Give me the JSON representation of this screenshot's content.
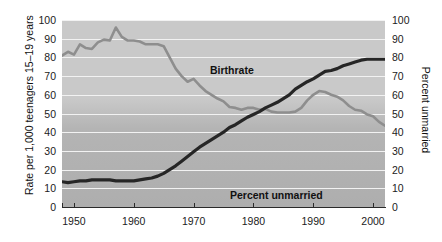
{
  "chart_data": {
    "type": "line",
    "title": "",
    "xlabel": "",
    "ylabel": "Rate per 1,000 teenagers 15–19 years",
    "y2label": "Percent unmarried",
    "xlim": [
      1948,
      2002
    ],
    "ylim": [
      0,
      100
    ],
    "y2lim": [
      0,
      100
    ],
    "grid": true,
    "legend_position": "inline-annotation",
    "xticks": [
      1950,
      1960,
      1970,
      1980,
      1990,
      2000
    ],
    "xtick_labels": [
      "1950",
      "1960",
      "1970",
      "1980",
      "1990",
      "2000"
    ],
    "yticks": [
      0,
      10,
      20,
      30,
      40,
      50,
      60,
      70,
      80,
      90,
      100
    ],
    "ytick_labels": [
      "0",
      "10",
      "20",
      "30",
      "40",
      "50",
      "60",
      "70",
      "80",
      "90",
      "100"
    ],
    "y2ticks": [
      0,
      10,
      20,
      30,
      40,
      50,
      60,
      70,
      80,
      90,
      100
    ],
    "y2tick_labels": [
      "0",
      "10",
      "20",
      "30",
      "40",
      "50",
      "60",
      "70",
      "80",
      "90",
      "100"
    ],
    "series": [
      {
        "name": "Birthrate",
        "axis": "left",
        "color": "#8e8e8e",
        "annotation": "Birthrate",
        "x": [
          1948,
          1949,
          1950,
          1951,
          1952,
          1953,
          1954,
          1955,
          1956,
          1957,
          1958,
          1959,
          1960,
          1961,
          1962,
          1963,
          1964,
          1965,
          1966,
          1967,
          1968,
          1969,
          1970,
          1971,
          1972,
          1973,
          1974,
          1975,
          1976,
          1977,
          1978,
          1979,
          1980,
          1981,
          1982,
          1983,
          1984,
          1985,
          1986,
          1987,
          1988,
          1989,
          1990,
          1991,
          1992,
          1993,
          1994,
          1995,
          1996,
          1997,
          1998,
          1999,
          2000,
          2001,
          2002
        ],
        "values": [
          81,
          83,
          81.5,
          87,
          85,
          84.5,
          88,
          89.5,
          89,
          96,
          91,
          89,
          89,
          88.5,
          87,
          87,
          87,
          86,
          80,
          74,
          70,
          67,
          68.5,
          65,
          62,
          60,
          58,
          56.5,
          53.5,
          53,
          52,
          53,
          53,
          52,
          52.5,
          51,
          50.5,
          50.5,
          50.5,
          51,
          53,
          57,
          60,
          62,
          61.5,
          60,
          59,
          57,
          54,
          52,
          51.5,
          49.5,
          48.5,
          45.5,
          43.5
        ]
      },
      {
        "name": "Percent unmarried",
        "axis": "right",
        "color": "#262626",
        "annotation": "Percent unmarried",
        "x": [
          1948,
          1949,
          1950,
          1951,
          1952,
          1953,
          1954,
          1955,
          1956,
          1957,
          1958,
          1959,
          1960,
          1961,
          1962,
          1963,
          1964,
          1965,
          1966,
          1967,
          1968,
          1969,
          1970,
          1971,
          1972,
          1973,
          1974,
          1975,
          1976,
          1977,
          1978,
          1979,
          1980,
          1981,
          1982,
          1983,
          1984,
          1985,
          1986,
          1987,
          1988,
          1989,
          1990,
          1991,
          1992,
          1993,
          1994,
          1995,
          1996,
          1997,
          1998,
          1999,
          2000,
          2001,
          2002
        ],
        "values": [
          13.5,
          13,
          13.5,
          14,
          14,
          14.5,
          14.5,
          14.5,
          14.5,
          14,
          14,
          14,
          14,
          14.5,
          15,
          15.5,
          16.5,
          18,
          20,
          22,
          24.5,
          27,
          29.5,
          32,
          34,
          36,
          38,
          40,
          42.5,
          44,
          46,
          48,
          49.5,
          51,
          53,
          54.5,
          56,
          58,
          60,
          63,
          65,
          67,
          68.5,
          70.5,
          72.5,
          73,
          74,
          75.5,
          76.5,
          77.5,
          78.5,
          79,
          79,
          79,
          79
        ]
      }
    ]
  },
  "axes": {
    "left_title": "Rate per 1,000 teenagers 15–19 years",
    "right_title": "Percent unmarried"
  },
  "annotations": {
    "birthrate": "Birthrate",
    "unmarried": "Percent unmarried"
  },
  "colors": {
    "birthrate_line": "#8e8e8e",
    "unmarried_line": "#262626",
    "plot_background_top": "#c9c9c9",
    "plot_background_bottom": "#aeaeae",
    "gridline": "#f2f2f2",
    "axis": "#2a2a2a",
    "text": "#111111"
  }
}
